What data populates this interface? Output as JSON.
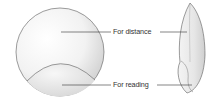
{
  "diagram": {
    "labels": [
      {
        "id": "distance",
        "text": "For distance"
      },
      {
        "id": "reading",
        "text": "For reading"
      }
    ],
    "views": [
      "front-view",
      "side-view"
    ],
    "colors": {
      "outline": "#555555",
      "shade": "#bdbdbd",
      "leader": "#333333",
      "text": "#333333"
    }
  }
}
